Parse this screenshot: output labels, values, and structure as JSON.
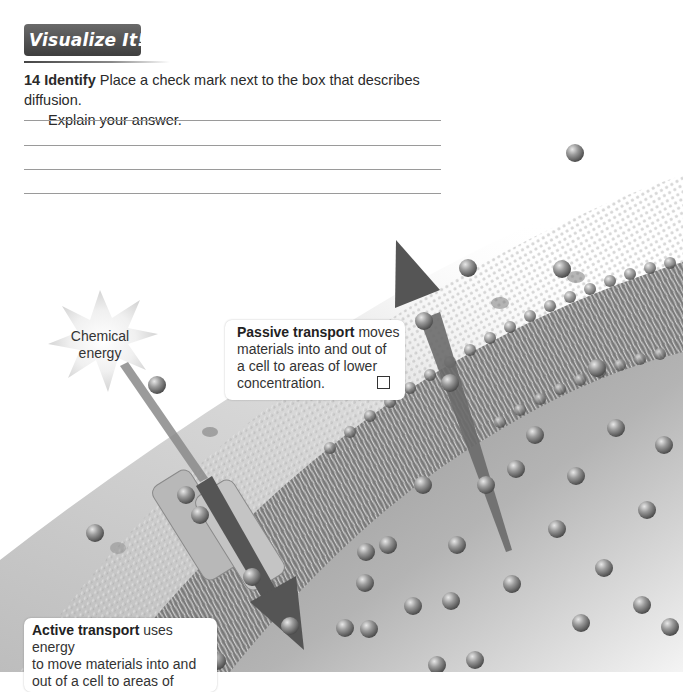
{
  "header": {
    "icon": "eye-icon",
    "title": "Visualize It!"
  },
  "question": {
    "number": "14",
    "verb": "Identify",
    "line1": "Place a check mark next to the box that describes diffusion.",
    "line2": "Explain your answer.",
    "answer_lines": 4
  },
  "illustration": {
    "energy_label_line1": "Chemical",
    "energy_label_line2": "energy",
    "passive": {
      "term": "Passive transport",
      "text_line1_rest": " moves",
      "text_line2": "materials into and out of",
      "text_line3": "a cell to areas of lower",
      "text_line4": "concentration.",
      "checked": false
    },
    "active": {
      "term": "Active transport",
      "text_line1_rest": " uses energy",
      "text_line2": "to move materials into and",
      "text_line3": "out of a cell to areas of",
      "checked": false
    }
  },
  "colors": {
    "banner_dark": "#4a4a4a",
    "rule_line": "#9a9a9a",
    "arrow": "#5a5a5a",
    "sphere": "#8c8c8c"
  }
}
